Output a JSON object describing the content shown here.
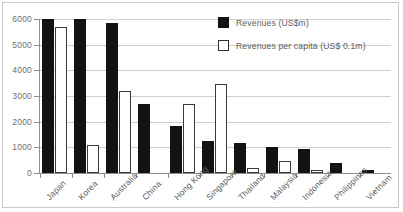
{
  "chart_data": {
    "type": "bar",
    "title": "",
    "subtitle": "",
    "xlabel": "",
    "ylabel": "",
    "ylim": [
      0,
      6000
    ],
    "ytick_values": [
      0,
      1000,
      2000,
      3000,
      4000,
      5000,
      6000
    ],
    "ytick_labels": [
      "0",
      "1000",
      "2000",
      "3000",
      "4000",
      "5000",
      "6000"
    ],
    "grid": true,
    "legend_position": "top-right",
    "categories": [
      "Japan",
      "Korea",
      "Australia",
      "China",
      "Hong Kong",
      "Singapore",
      "Thailand",
      "Malaysia",
      "Indonesia",
      "Philippines",
      "Vietnam"
    ],
    "series": [
      {
        "name": "Revenues (US$m)",
        "color": "#131313",
        "style": "filled",
        "values": [
          6000,
          6000,
          5850,
          2700,
          1850,
          1230,
          1180,
          1030,
          930,
          400,
          120
        ],
        "clipped_at_axis_max": [
          "Japan",
          "Korea"
        ]
      },
      {
        "name": "Revenues per capita (US$ 0.1m)",
        "color": "#ffffff",
        "style": "outlined",
        "values": [
          5700,
          1100,
          3200,
          0,
          2700,
          3450,
          180,
          450,
          110,
          0,
          0
        ]
      }
    ],
    "annotations": []
  },
  "legend": {
    "items": [
      {
        "label": "Revenues (US$m)",
        "swatch": "filled-square-icon"
      },
      {
        "label": "Revenues per capita (US$ 0.1m)",
        "swatch": "outlined-square-icon"
      }
    ]
  }
}
